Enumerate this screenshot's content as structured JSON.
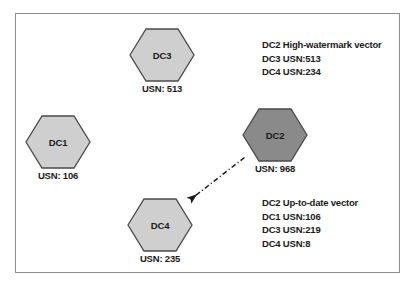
{
  "diagram": {
    "type": "replication-topology",
    "nodes": [
      {
        "id": "dc3",
        "label": "DC3",
        "usn_caption": "USN: 513",
        "fill": "#cfcfcf",
        "stroke": "#4a4a4a",
        "highlighted": false
      },
      {
        "id": "dc1",
        "label": "DC1",
        "usn_caption": "USN: 106",
        "fill": "#cfcfcf",
        "stroke": "#4a4a4a",
        "highlighted": false
      },
      {
        "id": "dc2",
        "label": "DC2",
        "usn_caption": "USN: 968",
        "fill": "#8a8a8a",
        "stroke": "#4a4a4a",
        "highlighted": true
      },
      {
        "id": "dc4",
        "label": "DC4",
        "usn_caption": "USN: 235",
        "fill": "#cfcfcf",
        "stroke": "#4a4a4a",
        "highlighted": false
      }
    ],
    "connector": {
      "from": "dc2",
      "to": "dc4",
      "style": "dash-dot",
      "arrowhead": "solid-triangle",
      "color": "#1a1a1a"
    },
    "annotations": {
      "high_watermark": {
        "title": "DC2 High-watermark vector",
        "lines": [
          "DC3 USN:513",
          "DC4 USN:234"
        ]
      },
      "up_to_date": {
        "title": "DC2 Up-to-date vector",
        "lines": [
          "DC1 USN:106",
          "DC3 USN:219",
          "DC4 USN:8"
        ]
      }
    }
  }
}
